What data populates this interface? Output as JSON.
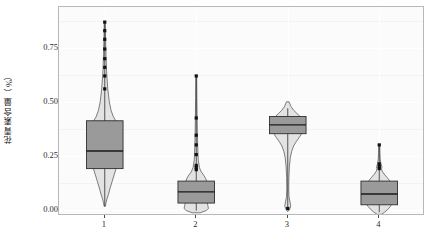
{
  "chart_data": {
    "type": "box",
    "title": "",
    "xlabel": "",
    "ylabel": "花青素含量（%）",
    "categories": [
      "1",
      "2",
      "3",
      "4"
    ],
    "ylim": [
      -0.03,
      0.94
    ],
    "yticks": [
      0.0,
      0.25,
      0.5,
      0.75
    ],
    "ytick_labels": [
      "0.00",
      "0.25",
      "0.50",
      "0.75"
    ],
    "grid": true,
    "legend": "none",
    "series": [
      {
        "name": "1",
        "category": "1",
        "min": 0.015,
        "q1": 0.19,
        "median": 0.272,
        "q3": 0.412,
        "whisker_low": 0.015,
        "whisker_high": 0.87,
        "outliers": [
          0.56,
          0.62,
          0.66,
          0.7,
          0.745,
          0.79,
          0.83,
          0.87
        ],
        "violin_widths": [
          {
            "y": 0.87,
            "w": 0.012
          },
          {
            "y": 0.8,
            "w": 0.018
          },
          {
            "y": 0.72,
            "w": 0.028
          },
          {
            "y": 0.64,
            "w": 0.042
          },
          {
            "y": 0.56,
            "w": 0.07
          },
          {
            "y": 0.5,
            "w": 0.105
          },
          {
            "y": 0.46,
            "w": 0.145
          },
          {
            "y": 0.43,
            "w": 0.2
          },
          {
            "y": 0.412,
            "w": 0.255
          },
          {
            "y": 0.38,
            "w": 0.29
          },
          {
            "y": 0.32,
            "w": 0.305
          },
          {
            "y": 0.272,
            "w": 0.305
          },
          {
            "y": 0.21,
            "w": 0.29
          },
          {
            "y": 0.19,
            "w": 0.262
          },
          {
            "y": 0.16,
            "w": 0.215
          },
          {
            "y": 0.13,
            "w": 0.17
          },
          {
            "y": 0.1,
            "w": 0.125
          },
          {
            "y": 0.07,
            "w": 0.085
          },
          {
            "y": 0.05,
            "w": 0.052
          },
          {
            "y": 0.032,
            "w": 0.03
          },
          {
            "y": 0.015,
            "w": 0.014
          }
        ]
      },
      {
        "name": "2",
        "category": "2",
        "min": -0.005,
        "q1": 0.03,
        "median": 0.082,
        "q3": 0.132,
        "whisker_low": -0.005,
        "whisker_high": 0.62,
        "outliers": [
          0.185,
          0.195,
          0.205,
          0.255,
          0.3,
          0.345,
          0.425,
          0.62
        ],
        "violin_widths": [
          {
            "y": 0.62,
            "w": 0.01
          },
          {
            "y": 0.52,
            "w": 0.014
          },
          {
            "y": 0.43,
            "w": 0.02
          },
          {
            "y": 0.35,
            "w": 0.026
          },
          {
            "y": 0.29,
            "w": 0.034
          },
          {
            "y": 0.23,
            "w": 0.046
          },
          {
            "y": 0.195,
            "w": 0.072
          },
          {
            "y": 0.175,
            "w": 0.115
          },
          {
            "y": 0.16,
            "w": 0.17
          },
          {
            "y": 0.145,
            "w": 0.215
          },
          {
            "y": 0.132,
            "w": 0.238
          },
          {
            "y": 0.115,
            "w": 0.228
          },
          {
            "y": 0.1,
            "w": 0.212
          },
          {
            "y": 0.082,
            "w": 0.225
          },
          {
            "y": 0.062,
            "w": 0.252
          },
          {
            "y": 0.045,
            "w": 0.268
          },
          {
            "y": 0.03,
            "w": 0.255
          },
          {
            "y": 0.018,
            "w": 0.268
          },
          {
            "y": 0.005,
            "w": 0.28
          },
          {
            "y": -0.005,
            "w": 0.23
          },
          {
            "y": -0.015,
            "w": 0.09
          }
        ]
      },
      {
        "name": "3",
        "category": "3",
        "min": 0.005,
        "q1": 0.352,
        "median": 0.393,
        "q3": 0.432,
        "whisker_low": 0.005,
        "whisker_high": 0.47,
        "outliers": [
          0.005
        ],
        "violin_widths": [
          {
            "y": 0.5,
            "w": 0.03
          },
          {
            "y": 0.478,
            "w": 0.075
          },
          {
            "y": 0.46,
            "w": 0.14
          },
          {
            "y": 0.445,
            "w": 0.215
          },
          {
            "y": 0.432,
            "w": 0.285
          },
          {
            "y": 0.415,
            "w": 0.345
          },
          {
            "y": 0.4,
            "w": 0.375
          },
          {
            "y": 0.385,
            "w": 0.378
          },
          {
            "y": 0.368,
            "w": 0.36
          },
          {
            "y": 0.352,
            "w": 0.32
          },
          {
            "y": 0.335,
            "w": 0.265
          },
          {
            "y": 0.315,
            "w": 0.195
          },
          {
            "y": 0.295,
            "w": 0.135
          },
          {
            "y": 0.27,
            "w": 0.09
          },
          {
            "y": 0.24,
            "w": 0.058
          },
          {
            "y": 0.2,
            "w": 0.038
          },
          {
            "y": 0.15,
            "w": 0.026
          },
          {
            "y": 0.1,
            "w": 0.022
          },
          {
            "y": 0.06,
            "w": 0.028
          },
          {
            "y": 0.035,
            "w": 0.052
          },
          {
            "y": 0.018,
            "w": 0.068
          },
          {
            "y": 0.005,
            "w": 0.052
          },
          {
            "y": -0.008,
            "w": 0.012
          }
        ]
      },
      {
        "name": "4",
        "category": "4",
        "min": -0.012,
        "q1": 0.022,
        "median": 0.072,
        "q3": 0.132,
        "whisker_low": -0.012,
        "whisker_high": 0.3,
        "outliers": [
          0.3,
          0.212,
          0.2,
          0.19
        ],
        "violin_widths": [
          {
            "y": 0.3,
            "w": 0.012
          },
          {
            "y": 0.265,
            "w": 0.016
          },
          {
            "y": 0.235,
            "w": 0.022
          },
          {
            "y": 0.212,
            "w": 0.04
          },
          {
            "y": 0.198,
            "w": 0.062
          },
          {
            "y": 0.188,
            "w": 0.052
          },
          {
            "y": 0.178,
            "w": 0.068
          },
          {
            "y": 0.165,
            "w": 0.11
          },
          {
            "y": 0.15,
            "w": 0.175
          },
          {
            "y": 0.132,
            "w": 0.245
          },
          {
            "y": 0.115,
            "w": 0.3
          },
          {
            "y": 0.095,
            "w": 0.345
          },
          {
            "y": 0.072,
            "w": 0.375
          },
          {
            "y": 0.05,
            "w": 0.355
          },
          {
            "y": 0.03,
            "w": 0.312
          },
          {
            "y": 0.015,
            "w": 0.258
          },
          {
            "y": 0.0,
            "w": 0.195
          },
          {
            "y": -0.012,
            "w": 0.125
          },
          {
            "y": -0.022,
            "w": 0.055
          }
        ]
      }
    ],
    "style": {
      "violin_fill": "#e3e3e3",
      "violin_stroke": "#4a4a4a",
      "box_fill": "#9a9a9a",
      "box_stroke": "#2e2e2e",
      "median_color": "#1a1a1a",
      "whisker_color": "#2e2e2e",
      "outlier_color": "#111111",
      "panel_bg": "#fbfbfb",
      "grid_color": "#ffffff",
      "axis_text": "#2b2b2b"
    }
  }
}
